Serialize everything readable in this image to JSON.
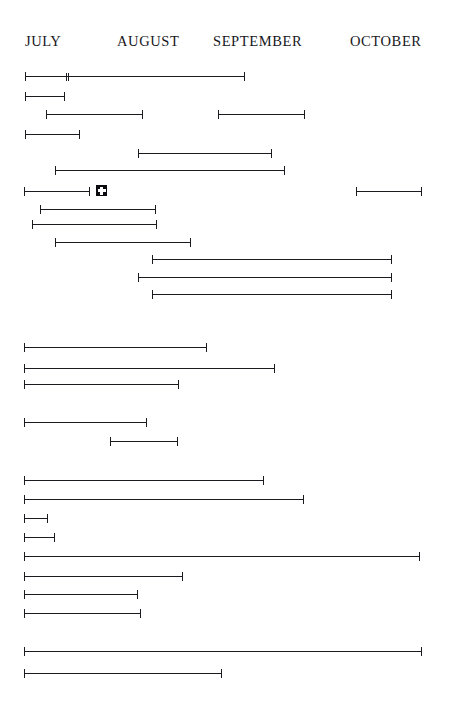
{
  "chart_data": {
    "type": "bar",
    "title": "",
    "subtitle": "",
    "xlabel": "",
    "ylabel": "",
    "orientation": "horizontal",
    "grid": false,
    "legend": null,
    "axis": {
      "name": "month-axis",
      "position": "top",
      "ticks": [
        {
          "label": "JULY",
          "x": 25
        },
        {
          "label": "AUGUST",
          "x": 117
        },
        {
          "label": "SEPTEMBER",
          "x": 213
        },
        {
          "label": "OCTOBER",
          "x": 350
        }
      ],
      "xlim_px": [
        0,
        455
      ]
    },
    "marker_legend": {
      "icon": "plus-square-icon",
      "label": ""
    },
    "rows": [
      {
        "index": 1,
        "y": 70,
        "segments": [
          {
            "start": 25,
            "end": 245
          }
        ],
        "ticks": [
          66,
          68
        ],
        "marker": null
      },
      {
        "index": 2,
        "y": 90,
        "segments": [
          {
            "start": 25,
            "end": 65
          }
        ],
        "ticks": [],
        "marker": null
      },
      {
        "index": 3,
        "y": 108,
        "segments": [
          {
            "start": 46,
            "end": 143
          },
          {
            "start": 218,
            "end": 305
          }
        ],
        "ticks": [],
        "marker": null
      },
      {
        "index": 4,
        "y": 128,
        "segments": [
          {
            "start": 25,
            "end": 80
          }
        ],
        "ticks": [],
        "marker": null
      },
      {
        "index": 5,
        "y": 147,
        "segments": [
          {
            "start": 138,
            "end": 272
          }
        ],
        "ticks": [],
        "marker": null
      },
      {
        "index": 6,
        "y": 164,
        "segments": [
          {
            "start": 55,
            "end": 285
          }
        ],
        "ticks": [],
        "marker": null
      },
      {
        "index": 7,
        "y": 185,
        "segments": [
          {
            "start": 24,
            "end": 90
          },
          {
            "start": 356,
            "end": 422
          }
        ],
        "ticks": [],
        "marker": {
          "x": 96,
          "icon": "plus-square-icon"
        }
      },
      {
        "index": 8,
        "y": 203,
        "segments": [
          {
            "start": 40,
            "end": 156
          }
        ],
        "ticks": [],
        "marker": null
      },
      {
        "index": 9,
        "y": 218,
        "segments": [
          {
            "start": 32,
            "end": 157
          }
        ],
        "ticks": [],
        "marker": null
      },
      {
        "index": 10,
        "y": 236,
        "segments": [
          {
            "start": 55,
            "end": 191
          }
        ],
        "ticks": [],
        "marker": null
      },
      {
        "index": 11,
        "y": 253,
        "segments": [
          {
            "start": 152,
            "end": 392
          }
        ],
        "ticks": [],
        "marker": null
      },
      {
        "index": 12,
        "y": 271,
        "segments": [
          {
            "start": 138,
            "end": 392
          }
        ],
        "ticks": [],
        "marker": null
      },
      {
        "index": 13,
        "y": 288,
        "segments": [
          {
            "start": 152,
            "end": 392
          }
        ],
        "ticks": [],
        "marker": null
      },
      {
        "index": 14,
        "y": 341,
        "segments": [
          {
            "start": 24,
            "end": 207
          }
        ],
        "ticks": [],
        "marker": null
      },
      {
        "index": 15,
        "y": 362,
        "segments": [
          {
            "start": 24,
            "end": 275
          }
        ],
        "ticks": [],
        "marker": null
      },
      {
        "index": 16,
        "y": 378,
        "segments": [
          {
            "start": 24,
            "end": 179
          }
        ],
        "ticks": [],
        "marker": null
      },
      {
        "index": 17,
        "y": 416,
        "segments": [
          {
            "start": 24,
            "end": 147
          }
        ],
        "ticks": [],
        "marker": null
      },
      {
        "index": 18,
        "y": 435,
        "segments": [
          {
            "start": 110,
            "end": 178
          }
        ],
        "ticks": [],
        "marker": null
      },
      {
        "index": 19,
        "y": 474,
        "segments": [
          {
            "start": 24,
            "end": 264
          }
        ],
        "ticks": [],
        "marker": null
      },
      {
        "index": 20,
        "y": 493,
        "segments": [
          {
            "start": 24,
            "end": 304
          }
        ],
        "ticks": [],
        "marker": null
      },
      {
        "index": 21,
        "y": 512,
        "segments": [
          {
            "start": 24,
            "end": 48
          }
        ],
        "ticks": [],
        "marker": null
      },
      {
        "index": 22,
        "y": 531,
        "segments": [
          {
            "start": 24,
            "end": 55
          }
        ],
        "ticks": [],
        "marker": null
      },
      {
        "index": 23,
        "y": 550,
        "segments": [
          {
            "start": 24,
            "end": 420
          }
        ],
        "ticks": [],
        "marker": null
      },
      {
        "index": 24,
        "y": 570,
        "segments": [
          {
            "start": 24,
            "end": 183
          }
        ],
        "ticks": [],
        "marker": null
      },
      {
        "index": 25,
        "y": 588,
        "segments": [
          {
            "start": 24,
            "end": 138
          }
        ],
        "ticks": [],
        "marker": null
      },
      {
        "index": 26,
        "y": 607,
        "segments": [
          {
            "start": 24,
            "end": 141
          }
        ],
        "ticks": [],
        "marker": null
      },
      {
        "index": 27,
        "y": 645,
        "segments": [
          {
            "start": 24,
            "end": 422
          }
        ],
        "ticks": [],
        "marker": null
      },
      {
        "index": 28,
        "y": 667,
        "segments": [
          {
            "start": 24,
            "end": 222
          }
        ],
        "ticks": [],
        "marker": null
      }
    ]
  }
}
